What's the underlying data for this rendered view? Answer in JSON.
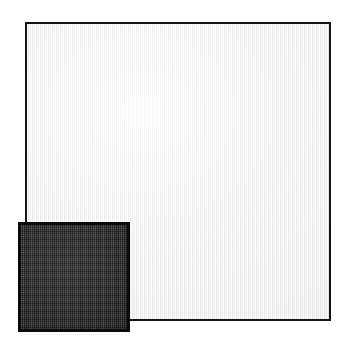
{
  "image": {
    "kind": "product-photograph",
    "subject": "two overlapping square fabric swatches",
    "width": 347,
    "height": 349,
    "background_color": "#ffffff"
  },
  "swatches": [
    {
      "id": "light",
      "name": "large-light-fabric-swatch",
      "shape": "square",
      "fill_color": "#f3f3f3",
      "border_color": "#141414",
      "border_width": 2,
      "texture": "fine-woven-grid",
      "position": {
        "left": 25,
        "top": 22,
        "width": 306,
        "height": 299
      },
      "z_order": 1
    },
    {
      "id": "dark",
      "name": "small-dark-fabric-swatch",
      "shape": "square",
      "fill_color": "#2b2b2b",
      "border_color": "#0b0b0b",
      "border_width": 3,
      "texture": "fine-woven-grid",
      "position": {
        "left": 18,
        "top": 222,
        "width": 112,
        "height": 110
      },
      "z_order": 2
    }
  ]
}
